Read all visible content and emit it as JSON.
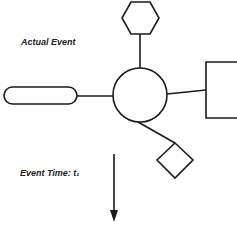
{
  "labels": {
    "actual_event": "Actual Event",
    "event_time": "Event Time: t₁"
  },
  "colors": {
    "stroke": "#1a1a1a",
    "background": "#ffffff"
  },
  "shapes": {
    "center": "circle",
    "top": "hexagon",
    "left": "rounded-pill",
    "right": "square",
    "bottom_right": "diamond"
  },
  "arrow": {
    "direction": "down"
  }
}
